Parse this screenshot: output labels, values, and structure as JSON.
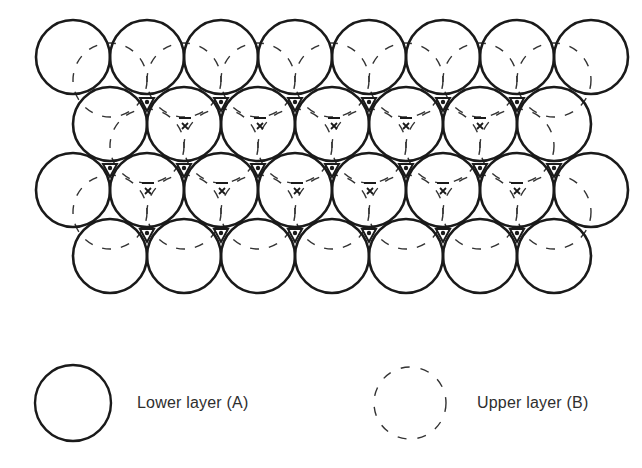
{
  "diagram": {
    "radius": 37,
    "colors": {
      "stroke": "#1a1a1a",
      "dashed": "#333333",
      "background": "#ffffff"
    },
    "lower_layer_rows": [
      {
        "y": 57,
        "x": [
          73,
          147,
          221,
          295,
          369,
          443,
          517,
          591
        ]
      },
      {
        "y": 124,
        "x": [
          110,
          184,
          258,
          332,
          406,
          480,
          554
        ]
      },
      {
        "y": 190,
        "x": [
          73,
          147,
          221,
          295,
          369,
          443,
          517,
          591
        ]
      },
      {
        "y": 256,
        "x": [
          110,
          184,
          258,
          332,
          406,
          480,
          554
        ]
      }
    ],
    "upper_layer_rows": [
      {
        "y": 80,
        "x": [
          110,
          184,
          258,
          332,
          406,
          480,
          554
        ]
      },
      {
        "y": 146,
        "x": [
          147,
          221,
          295,
          369,
          443,
          517
        ]
      },
      {
        "y": 212,
        "x": [
          110,
          184,
          258,
          332,
          406,
          480,
          554
        ]
      }
    ],
    "hole_dots": [
      {
        "y": 103,
        "x": [
          147,
          221,
          295,
          369,
          443,
          517
        ]
      },
      {
        "y": 169,
        "x": [
          110,
          184,
          258,
          332,
          406,
          480,
          554
        ]
      },
      {
        "y": 234,
        "x": [
          147,
          221,
          295,
          369,
          443,
          517
        ]
      }
    ],
    "cross_marks": [
      {
        "y": 126,
        "x": [
          185,
          260,
          334,
          406,
          480
        ]
      },
      {
        "y": 191,
        "x": [
          148,
          222,
          297,
          370,
          443,
          517
        ]
      }
    ]
  },
  "legend": {
    "lower": {
      "label": "Lower layer (A)",
      "cx": 73,
      "cy": 403,
      "r": 38,
      "style": "solid"
    },
    "upper": {
      "label": "Upper layer (B)",
      "cx": 410,
      "cy": 403,
      "r": 36,
      "style": "dashed"
    }
  }
}
